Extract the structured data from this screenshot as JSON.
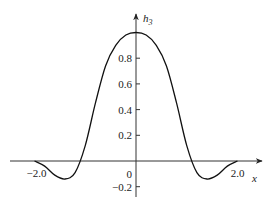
{
  "chart_data": {
    "type": "line",
    "title": "",
    "xlabel": "x",
    "ylabel": "h3",
    "ylabel_main": "h",
    "ylabel_sub": "3",
    "xlim": [
      -2.0,
      2.0
    ],
    "ylim": [
      -0.2,
      1.0
    ],
    "grid": false,
    "x_ticks": [
      -2.0,
      0,
      2.0
    ],
    "x_tick_labels": [
      "−2.0",
      "0",
      "2.0"
    ],
    "y_ticks": [
      0.8,
      0.6,
      0.4,
      0.2,
      -0.2
    ],
    "y_tick_labels": [
      "0.8",
      "0.6",
      "0.4",
      "0.2",
      "−0.2"
    ],
    "series": [
      {
        "name": "h3",
        "x": [
          -2.0,
          -1.8,
          -1.6,
          -1.4,
          -1.2,
          -1.0,
          -0.8,
          -0.6,
          -0.4,
          -0.2,
          0.0,
          0.2,
          0.4,
          0.6,
          0.8,
          1.0,
          1.2,
          1.4,
          1.6,
          1.8,
          2.0
        ],
        "y": [
          0.0,
          -0.04,
          -0.11,
          -0.14,
          -0.09,
          0.12,
          0.45,
          0.74,
          0.9,
          0.98,
          1.0,
          0.98,
          0.9,
          0.74,
          0.45,
          0.12,
          -0.09,
          -0.14,
          -0.11,
          -0.04,
          0.0
        ]
      }
    ]
  }
}
